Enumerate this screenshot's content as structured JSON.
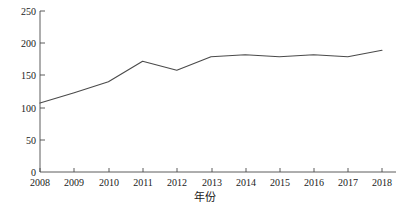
{
  "chart_data": {
    "type": "line",
    "title": "",
    "subtitle": "",
    "xlabel": "年份",
    "ylabel": "",
    "categories": [
      "2008",
      "2009",
      "2010",
      "2011",
      "2012",
      "2013",
      "2014",
      "2015",
      "2016",
      "2017",
      "2018"
    ],
    "x": [
      2008,
      2009,
      2010,
      2011,
      2012,
      2013,
      2014,
      2015,
      2016,
      2017,
      2018
    ],
    "values": [
      107,
      123,
      140,
      172,
      158,
      179,
      182,
      179,
      182,
      179,
      189
    ],
    "series": [
      {
        "name": "",
        "values": [
          107,
          123,
          140,
          172,
          158,
          179,
          182,
          179,
          182,
          179,
          189
        ]
      }
    ],
    "xlim": [
      2008,
      2018
    ],
    "ylim": [
      0,
      250
    ],
    "ytick_labels": [
      "0",
      "50",
      "100",
      "150",
      "200",
      "250"
    ],
    "ytick_values": [
      0,
      50,
      100,
      150,
      200,
      250
    ],
    "xtick_labels": [
      "2008",
      "2009",
      "2010",
      "2011",
      "2012",
      "2013",
      "2014",
      "2015",
      "2016",
      "2017",
      "2018"
    ],
    "grid": false,
    "legend": false,
    "legend_position": "none",
    "line_color": "#4a4a4a",
    "axis_color": "#4a4a4a",
    "background_color": "#ffffff"
  },
  "axis": {
    "y_ticks": [
      {
        "label": "250",
        "value": 250
      },
      {
        "label": "200",
        "value": 200
      },
      {
        "label": "150",
        "value": 150
      },
      {
        "label": "100",
        "value": 100
      },
      {
        "label": "50",
        "value": 50
      },
      {
        "label": "0",
        "value": 0
      }
    ],
    "x_ticks": [
      {
        "label": "2008",
        "value": 2008
      },
      {
        "label": "2009",
        "value": 2009
      },
      {
        "label": "2010",
        "value": 2010
      },
      {
        "label": "2011",
        "value": 2011
      },
      {
        "label": "2012",
        "value": 2012
      },
      {
        "label": "2013",
        "value": 2013
      },
      {
        "label": "2014",
        "value": 2014
      },
      {
        "label": "2015",
        "value": 2015
      },
      {
        "label": "2016",
        "value": 2016
      },
      {
        "label": "2017",
        "value": 2017
      },
      {
        "label": "2018",
        "value": 2018
      }
    ],
    "x_title": "年份"
  }
}
